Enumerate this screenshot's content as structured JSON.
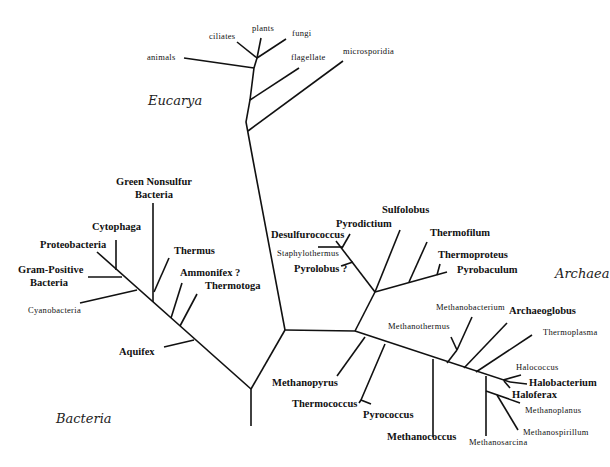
{
  "figure": {
    "type": "unrooted phylogenetic tree of life",
    "title_partial": ""
  },
  "domains": {
    "eucarya": "Eucarya",
    "bacteria": "Bacteria",
    "archaea": "Archaea"
  },
  "taxa": {
    "eucarya": {
      "animals": "animals",
      "ciliates": "ciliates",
      "plants": "plants",
      "fungi": "fungi",
      "flagellate": "flagellate",
      "microsporidia": "microsporidia"
    },
    "bacteria": {
      "green_nonsulfur_1": "Green Nonsulfur",
      "green_nonsulfur_2": "Bacteria",
      "cytophaga": "Cytophaga",
      "proteobacteria": "Proteobacteria",
      "gram_positive_1": "Gram-Positive",
      "gram_positive_2": "Bacteria",
      "cyanobacteria": "Cyanobacteria",
      "thermus": "Thermus",
      "ammonifex": "Ammonifex ?",
      "thermotoga": "Thermotoga",
      "aquifex": "Aquifex"
    },
    "archaea": {
      "desulfurococcus": "Desulfurococcus",
      "pyrodictium": "Pyrodictium",
      "staphylothermus": "Staphylothermus",
      "pyrolobus": "Pyrolobus ?",
      "sulfolobus": "Sulfolobus",
      "thermofilum": "Thermofilum",
      "thermoproteus": "Thermoproteus",
      "pyrobaculum": "Pyrobaculum",
      "methanobacterium": "Methanobacterium",
      "methanothermus": "Methanothermus",
      "archaeoglobus": "Archaeoglobus",
      "thermoplasma": "Thermoplasma",
      "halococcus": "Halococcus",
      "halobacterium": "Halobacterium",
      "haloferax": "Haloferax",
      "methanoplanus": "Methanoplanus",
      "methanospirillum": "Methanospirillum",
      "methanosarcina": "Methanosarcina",
      "methanococcus": "Methanococcus",
      "methanopyrus": "Methanopyrus",
      "thermococcus": "Thermococcus",
      "pyrococcus": "Pyrococcus"
    }
  },
  "colors": {
    "line": "#111111",
    "text": "#111111",
    "background": "#ffffff"
  }
}
